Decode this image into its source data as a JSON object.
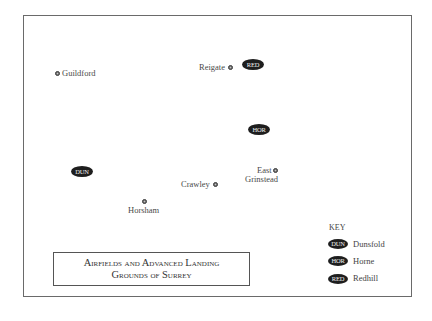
{
  "map": {
    "title_line1": "Airfields and Advanced Landing",
    "title_line2": "Grounds of Surrey",
    "towns": [
      {
        "name": "Guildford"
      },
      {
        "name": "Reigate"
      },
      {
        "name": "Crawley"
      },
      {
        "name": "Horsham"
      },
      {
        "name": "East",
        "name2": "Grinstead"
      }
    ],
    "airfields": [
      {
        "code": "RED"
      },
      {
        "code": "HOR"
      },
      {
        "code": "DUN"
      }
    ],
    "key": {
      "title": "KEY",
      "entries": [
        {
          "code": "DUN",
          "name": "Dunsfold"
        },
        {
          "code": "HOR",
          "name": "Horne"
        },
        {
          "code": "RED",
          "name": "Redhill"
        }
      ]
    }
  }
}
